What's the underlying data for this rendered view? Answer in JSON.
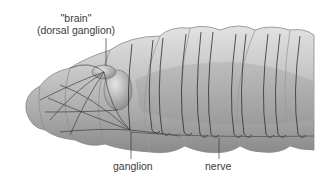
{
  "diagram": {
    "labels": {
      "brain_line1": "\"brain\"",
      "brain_line2": "(dorsal ganglion)",
      "ganglion": "ganglion",
      "nerve": "nerve"
    },
    "colors": {
      "background": "#ffffff",
      "body_fill": "#b9b9b9",
      "body_dark": "#8e8e8e",
      "body_light": "#dcdcdc",
      "nerve_stroke": "#2e2e2e",
      "label_text": "#3a3a3a",
      "leader_line": "#3a3a3a"
    },
    "segments": 7
  }
}
